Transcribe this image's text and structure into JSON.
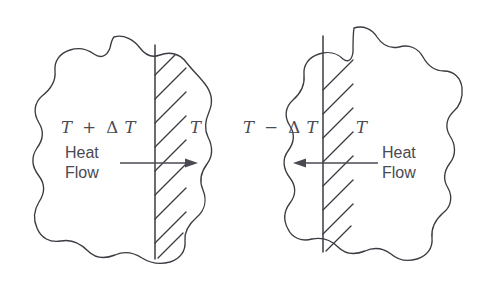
{
  "figure": {
    "title": "Heat flow across an interface between two regions at different temperatures",
    "background_color": "#ffffff",
    "line_color": "#3b3b42",
    "text_color": "#4a4a52",
    "width": 483,
    "height": 297
  },
  "panels": [
    {
      "id": "left",
      "name": "heat-flow-outward",
      "hot_label": "T + ΔT",
      "hot_label_parts": {
        "symbol_1": "T",
        "operator": "+",
        "delta": "Δ",
        "symbol_2": "T"
      },
      "cold_label": "T",
      "flow_label_line1": "Heat",
      "flow_label_line2": "Flow",
      "arrow_direction": "right"
    },
    {
      "id": "right",
      "name": "heat-flow-inward",
      "hot_label": "T − ΔT",
      "hot_label_parts": {
        "symbol_1": "T",
        "operator": "−",
        "delta": "Δ",
        "symbol_2": "T"
      },
      "cold_label": "T",
      "flow_label_line1": "Heat",
      "flow_label_line2": "Flow",
      "arrow_direction": "left"
    }
  ]
}
